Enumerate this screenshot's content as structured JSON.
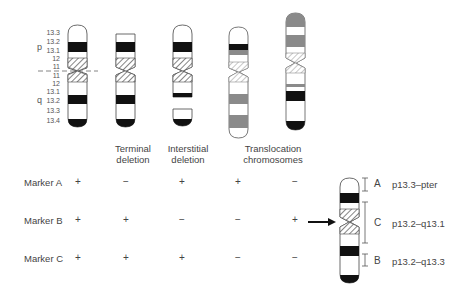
{
  "ideogram": {
    "arm_labels": {
      "p": "p",
      "q": "q"
    },
    "band_labels": [
      "13.3",
      "13.2",
      "13.1",
      "12",
      "11",
      "11",
      "12",
      "13.1",
      "13.2",
      "13.3",
      "13.4"
    ]
  },
  "columns": [
    {
      "label_line1": "Terminal",
      "label_line2": "deletion"
    },
    {
      "label_line1": "Interstitial",
      "label_line2": "deletion"
    },
    {
      "label_line1": "Translocation",
      "label_line2": "chromosomes"
    }
  ],
  "markers": [
    {
      "name": "Marker A",
      "signs": [
        "+",
        "−",
        "+",
        "+",
        "−"
      ]
    },
    {
      "name": "Marker B",
      "signs": [
        "+",
        "+",
        "−",
        "−",
        "+"
      ]
    },
    {
      "name": "Marker C",
      "signs": [
        "+",
        "+",
        "+",
        "−",
        "−"
      ]
    }
  ],
  "regions": [
    {
      "letter": "A",
      "range": "p13.3–pter"
    },
    {
      "letter": "C",
      "range": "p13.2–q13.1"
    },
    {
      "letter": "B",
      "range": "p13.2–q13.3"
    }
  ],
  "colors": {
    "black_band": "#111111",
    "gray_band": "#8a8a8a",
    "outline": "#444444"
  }
}
